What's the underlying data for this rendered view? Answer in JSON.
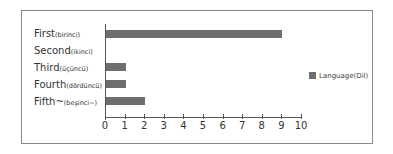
{
  "chart_data": {
    "type": "bar",
    "orientation": "horizontal",
    "categories": [
      {
        "main": "First",
        "sub": "(birinci)"
      },
      {
        "main": "Second",
        "sub": "(ikinci)"
      },
      {
        "main": "Third",
        "sub": "(üçüncü)"
      },
      {
        "main": "Fourth",
        "sub": "(dördüncü)"
      },
      {
        "main": "Fifth~",
        "sub": "(beşinci~)"
      }
    ],
    "series": [
      {
        "name": "Language(Dil)",
        "values": [
          9,
          0,
          1,
          1,
          2
        ],
        "color": "#6e6e6e"
      }
    ],
    "xlim": [
      0,
      10
    ],
    "xticks": [
      "0",
      "1",
      "2",
      "3",
      "4",
      "5",
      "6",
      "7",
      "8",
      "9",
      "10"
    ],
    "title": "",
    "xlabel": "",
    "ylabel": "",
    "grid": false,
    "legend_position": "right"
  },
  "legend": {
    "label": "Language(Dil)"
  }
}
